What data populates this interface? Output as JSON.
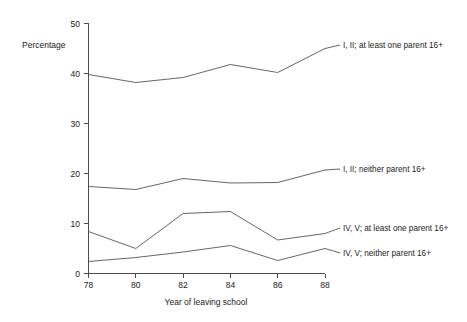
{
  "chart_data": {
    "type": "line",
    "title": "",
    "subtitle": "",
    "xlabel": "Year of leaving school",
    "ylabel": "Percentage",
    "x": [
      78,
      80,
      82,
      84,
      86,
      88
    ],
    "xtick_labels": [
      "78",
      "80",
      "82",
      "84",
      "86",
      "88"
    ],
    "ytick_labels": [
      "0",
      "10",
      "20",
      "30",
      "40",
      "50"
    ],
    "yticks": [
      0,
      10,
      20,
      30,
      40,
      50
    ],
    "xlim": [
      78,
      88
    ],
    "ylim": [
      0,
      50
    ],
    "grid": false,
    "legend_position": "right-inline-labels",
    "series": [
      {
        "name": "I, II; at least one parent 16+",
        "values": [
          39.8,
          38.2,
          39.2,
          41.8,
          40.2,
          45.0
        ]
      },
      {
        "name": "I, II; neither parent 16+",
        "values": [
          17.4,
          16.8,
          19.0,
          18.1,
          18.2,
          20.7
        ]
      },
      {
        "name": "IV, V; at least one parent 16+",
        "values": [
          8.4,
          5.0,
          12.0,
          12.4,
          6.7,
          8.0
        ]
      },
      {
        "name": "IV, V; neither parent 16+",
        "values": [
          2.4,
          3.2,
          4.3,
          5.6,
          2.6,
          5.0
        ]
      }
    ],
    "colors": {
      "line": "#555555",
      "axis": "#4a4a4a",
      "text": "#1a1a1a",
      "background": "#ffffff"
    }
  },
  "labels": {
    "y_axis_title": "Percentage",
    "x_axis_title": "Year of leaving school",
    "series_0": "I, II; at least one parent 16+",
    "series_1": "I, II; neither parent 16+",
    "series_2": "IV, V; at least one parent 16+",
    "series_3": "IV, V; neither parent 16+",
    "ytick_0": "0",
    "ytick_10": "10",
    "ytick_20": "20",
    "ytick_30": "30",
    "ytick_40": "40",
    "ytick_50": "50",
    "xtick_78": "78",
    "xtick_80": "80",
    "xtick_82": "82",
    "xtick_84": "84",
    "xtick_86": "86",
    "xtick_88": "88"
  }
}
